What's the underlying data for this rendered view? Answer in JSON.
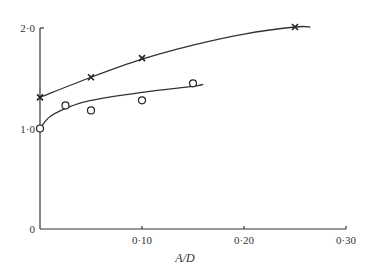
{
  "chart_data": {
    "type": "scatter",
    "title": "",
    "xlabel": "A/D",
    "ylabel": "",
    "xlim": [
      0,
      0.3
    ],
    "ylim": [
      0,
      2.0
    ],
    "grid": false,
    "legend": null,
    "x_ticks": [
      {
        "value": 0.1,
        "label": "0·10"
      },
      {
        "value": 0.2,
        "label": "0·20"
      },
      {
        "value": 0.3,
        "label": "0·30"
      }
    ],
    "y_ticks": [
      {
        "value": 0,
        "label": "0"
      },
      {
        "value": 1.0,
        "label": "1·0"
      },
      {
        "value": 2.0,
        "label": "2·0"
      }
    ],
    "series": [
      {
        "name": "crosses",
        "marker": "x",
        "points": [
          {
            "x": 0.0,
            "y": 1.31
          },
          {
            "x": 0.05,
            "y": 1.51
          },
          {
            "x": 0.1,
            "y": 1.7
          },
          {
            "x": 0.25,
            "y": 2.01
          }
        ],
        "fit_curve": [
          [
            0.0,
            1.31
          ],
          [
            0.05,
            1.51
          ],
          [
            0.1,
            1.69
          ],
          [
            0.15,
            1.83
          ],
          [
            0.2,
            1.94
          ],
          [
            0.25,
            2.01
          ],
          [
            0.265,
            2.01
          ]
        ]
      },
      {
        "name": "circles",
        "marker": "o",
        "points": [
          {
            "x": 0.0,
            "y": 1.0
          },
          {
            "x": 0.025,
            "y": 1.23
          },
          {
            "x": 0.05,
            "y": 1.18
          },
          {
            "x": 0.1,
            "y": 1.28
          },
          {
            "x": 0.15,
            "y": 1.45
          }
        ],
        "fit_curve": [
          [
            0.0,
            1.0
          ],
          [
            0.01,
            1.12
          ],
          [
            0.03,
            1.22
          ],
          [
            0.05,
            1.28
          ],
          [
            0.1,
            1.36
          ],
          [
            0.15,
            1.42
          ],
          [
            0.16,
            1.44
          ]
        ]
      }
    ]
  }
}
